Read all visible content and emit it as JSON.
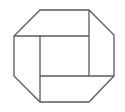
{
  "diagram": {
    "background": "#ffffff",
    "stroke": "#5a5a5a",
    "stroke_width": 1.3,
    "octagon": [
      [
        40,
        10
      ],
      [
        89,
        10
      ],
      [
        114,
        35
      ],
      [
        114,
        76
      ],
      [
        89,
        102
      ],
      [
        40,
        102
      ],
      [
        14,
        76
      ],
      [
        14,
        36
      ]
    ],
    "inner_lines": [
      {
        "x1": 14,
        "y1": 36,
        "x2": 89,
        "y2": 36
      },
      {
        "x1": 89,
        "y1": 10,
        "x2": 89,
        "y2": 76
      },
      {
        "x1": 40,
        "y1": 76,
        "x2": 114,
        "y2": 76
      },
      {
        "x1": 40,
        "y1": 36,
        "x2": 40,
        "y2": 102
      }
    ]
  }
}
